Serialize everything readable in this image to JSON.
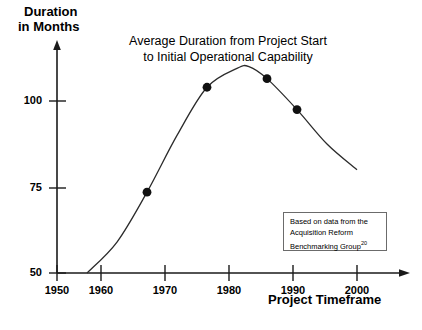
{
  "chart_data": {
    "type": "line",
    "title": "Average Duration from Project Start to Initial Operational Capability",
    "title_line1": "Average Duration from Project Start",
    "title_line2": "to Initial Operational Capability",
    "xlabel": "Project Timeframe",
    "ylabel": "Duration in Months",
    "ylabel_line1": "Duration",
    "ylabel_line2": "in Months",
    "xlim": [
      1950,
      2004
    ],
    "ylim": [
      50,
      114
    ],
    "xticks": [
      1950,
      1960,
      1970,
      1980,
      1990,
      2000
    ],
    "xtick_labels": [
      "1950",
      "1960",
      "1970",
      "1980",
      "1990",
      "2000"
    ],
    "yticks": [
      50,
      75,
      100
    ],
    "ytick_labels": [
      "50",
      "75",
      "100"
    ],
    "grid": false,
    "legend": "none",
    "series": [
      {
        "name": "Average duration",
        "marker_points": [
          {
            "x": 1965,
            "y": 73.5
          },
          {
            "x": 1975,
            "y": 104.0
          },
          {
            "x": 1985,
            "y": 106.5
          },
          {
            "x": 1990,
            "y": 97.5
          }
        ],
        "curve_points": [
          {
            "x": 1955,
            "y": 50.0
          },
          {
            "x": 1960,
            "y": 59.0
          },
          {
            "x": 1965,
            "y": 73.5
          },
          {
            "x": 1970,
            "y": 90.0
          },
          {
            "x": 1975,
            "y": 104.0
          },
          {
            "x": 1980,
            "y": 109.5
          },
          {
            "x": 1982,
            "y": 110.0
          },
          {
            "x": 1985,
            "y": 106.5
          },
          {
            "x": 1990,
            "y": 97.5
          },
          {
            "x": 1995,
            "y": 87.5
          },
          {
            "x": 2000,
            "y": 80.0
          }
        ]
      }
    ]
  },
  "source_note": {
    "line1": "Based on data from the",
    "line2": "Acquisition Reform",
    "line3": "Benchmarking Group",
    "superscript": "20"
  },
  "colors": {
    "axis": "#1a1a1a",
    "curve": "#2b2b2b",
    "marker": "#111111",
    "note_border": "#6b6b6b",
    "background": "#ffffff"
  }
}
